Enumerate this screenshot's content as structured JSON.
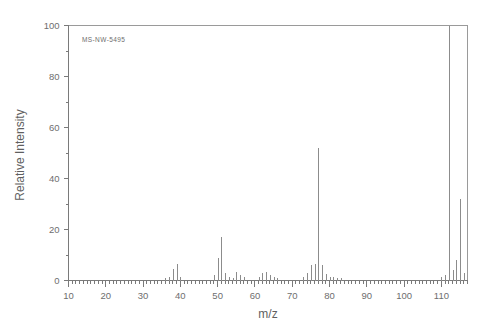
{
  "chart_data": {
    "type": "bar",
    "title": "",
    "subtitle": "",
    "annotation": "MS-NW-5495",
    "xlabel": "m/z",
    "ylabel": "Relative Intensity",
    "xlim": [
      10,
      117
    ],
    "ylim": [
      0,
      100
    ],
    "grid": false,
    "legend": null,
    "x_ticks_major": [
      10,
      20,
      30,
      40,
      50,
      60,
      70,
      80,
      90,
      100,
      110
    ],
    "x_tick_labels": [
      "10",
      "20",
      "30",
      "40",
      "50",
      "60",
      "70",
      "80",
      "90",
      "100",
      "110"
    ],
    "x_minor_tick_step": 1,
    "y_ticks_major": [
      0,
      20,
      40,
      60,
      80,
      100
    ],
    "y_tick_labels": [
      "0",
      "20",
      "40",
      "60",
      "80",
      "100"
    ],
    "y_minor_ticks": [
      10,
      30,
      50,
      70,
      90
    ],
    "x": [
      36,
      37,
      38,
      39,
      40,
      49,
      50,
      51,
      52,
      53,
      54,
      55,
      56,
      57,
      61,
      62,
      63,
      64,
      65,
      66,
      73,
      74,
      75,
      76,
      77,
      78,
      79,
      80,
      81,
      82,
      83,
      110,
      111,
      112,
      113,
      114,
      115,
      116
    ],
    "values": [
      1.0,
      1.5,
      4.5,
      6.5,
      1.2,
      2.0,
      9.0,
      17.0,
      3.0,
      1.2,
      1.0,
      3.5,
      2.0,
      1.2,
      1.5,
      3.0,
      3.5,
      2.0,
      1.5,
      1.0,
      1.5,
      3.0,
      6.0,
      6.5,
      52.0,
      6.0,
      2.5,
      1.5,
      1.2,
      1.0,
      1.0,
      1.5,
      2.0,
      100.0,
      4.0,
      8.0,
      32.0,
      3.0
    ],
    "base_peak_mz": 112,
    "base_peak_intensity": 100
  },
  "axes": {
    "y_axis_title": "Relative Intensity",
    "x_axis_title": "m/z"
  },
  "labels": {
    "sample_id": "MS-NW-5495"
  },
  "colors": {
    "background": "#ffffff",
    "frame": "#9a9a9a",
    "axis": "#7a7a7a",
    "peak": "#8c8c8c",
    "text": "#6e6e6e"
  }
}
